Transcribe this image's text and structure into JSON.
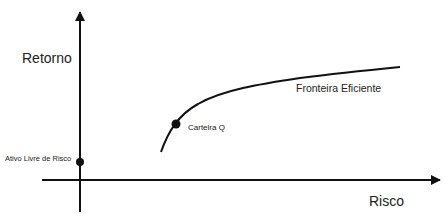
{
  "diagram": {
    "type": "efficient-frontier",
    "axes": {
      "y_label": "Retorno",
      "x_label": "Risco"
    },
    "curve_label": "Fronteira Eficiente",
    "points": [
      {
        "id": "risk_free",
        "label": "Ativo Livre de Risco"
      },
      {
        "id": "portfolio_q",
        "label": "Carteira Q"
      }
    ],
    "colors": {
      "line": "#111111",
      "background": "#ffffff"
    }
  }
}
